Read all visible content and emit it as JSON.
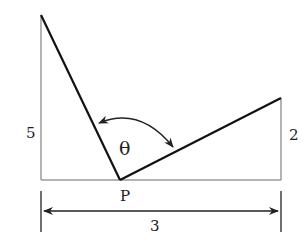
{
  "diagram": {
    "type": "geometry",
    "labels": {
      "left_height": "5",
      "right_height": "2",
      "base_length": "3",
      "point": "P",
      "angle": "θ"
    },
    "colors": {
      "main_lines": "#111111",
      "guide_lines": "#9a9a9a",
      "dimension": "#222222"
    },
    "geometry": {
      "left_post_top": [
        41,
        15
      ],
      "left_post_bottom": [
        41,
        180
      ],
      "right_post_top": [
        281,
        98
      ],
      "right_post_bottom": [
        281,
        180
      ],
      "point_P": [
        120,
        180
      ]
    }
  }
}
